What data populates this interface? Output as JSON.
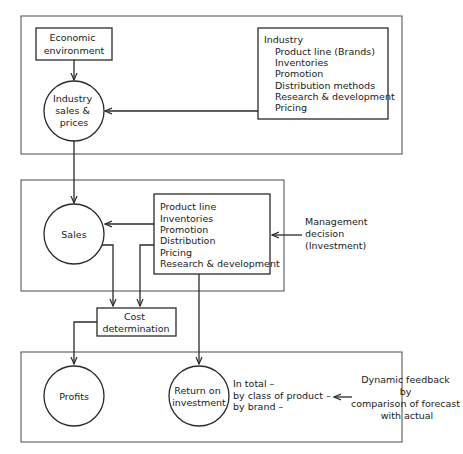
{
  "diagram": {
    "type": "flowchart",
    "panels": [
      {
        "name": "industry-panel",
        "nodes": {
          "economic_environment": {
            "lines": [
              "Economic",
              "environment"
            ]
          },
          "industry_sales_prices": {
            "lines": [
              "Industry",
              "sales &",
              "prices"
            ]
          },
          "industry_factors": {
            "heading": "Industry",
            "items": [
              "Product line (Brands)",
              "Inventories",
              "Promotion",
              "Distribution  methods",
              "Research & development",
              "Pricing"
            ]
          }
        }
      },
      {
        "name": "company-panel",
        "nodes": {
          "sales": {
            "lines": [
              "Sales"
            ]
          },
          "company_factors": {
            "items": [
              "Product line",
              "Inventories",
              "Promotion",
              "Distribution",
              "Pricing",
              "Research & development"
            ]
          }
        },
        "external_input": {
          "lines": [
            "Management",
            "decision",
            "(Investment)"
          ]
        }
      },
      {
        "name": "cost-node",
        "nodes": {
          "cost_determination": {
            "lines": [
              "Cost",
              "determination"
            ]
          }
        }
      },
      {
        "name": "results-panel",
        "nodes": {
          "profits": {
            "lines": [
              "Profits"
            ]
          },
          "return_on_investment": {
            "lines": [
              "Return on",
              "investment"
            ]
          },
          "breakdown": {
            "items": [
              "In total –",
              "by class of product –",
              "by brand –"
            ]
          }
        },
        "external_input": {
          "lines": [
            "Dynamic feedback",
            "by",
            "comparison of forecast",
            "with actual"
          ]
        }
      }
    ],
    "edges": [
      {
        "from": "Economic environment",
        "to": "Industry sales & prices"
      },
      {
        "from": "Industry factors",
        "to": "Industry sales & prices"
      },
      {
        "from": "Industry sales & prices",
        "to": "Sales"
      },
      {
        "from": "Company factors",
        "to": "Sales"
      },
      {
        "from": "Management decision (Investment)",
        "to": "Company factors"
      },
      {
        "from": "Sales",
        "to": "Cost determination"
      },
      {
        "from": "Company factors",
        "to": "Cost determination"
      },
      {
        "from": "Cost determination",
        "to": "Profits"
      },
      {
        "from": "Company factors",
        "to": "Return on investment"
      },
      {
        "from": "Dynamic feedback",
        "to": "Results panel"
      }
    ]
  }
}
